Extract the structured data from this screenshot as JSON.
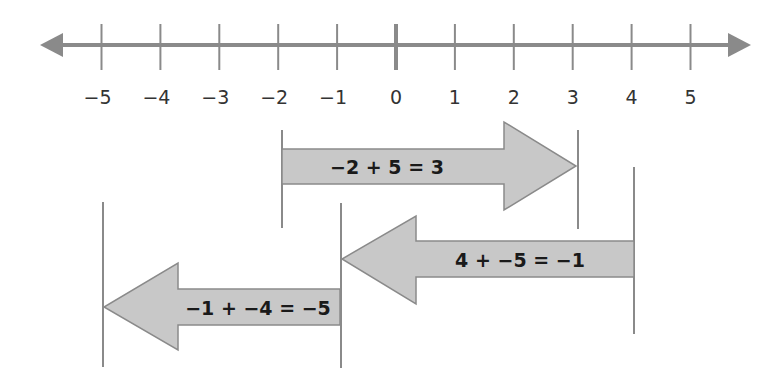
{
  "diagram": {
    "type": "number-line-addition",
    "number_line": {
      "min": -5,
      "max": 5,
      "tick_labels": [
        "−5",
        "−4",
        "−3",
        "−2",
        "−1",
        "0",
        "1",
        "2",
        "3",
        "4",
        "5"
      ],
      "tick_values": [
        -5,
        -4,
        -3,
        -2,
        -1,
        0,
        1,
        2,
        3,
        4,
        5
      ],
      "both_ends_arrows": true,
      "zero_tick_emphasized": true
    },
    "arrows": [
      {
        "label": "−2 + 5 = 3",
        "start": -2,
        "end": 3,
        "direction": "right"
      },
      {
        "label": "4 + −5 = −1",
        "start": 4,
        "end": -1,
        "direction": "left"
      },
      {
        "label": "−1 + −4 = −5",
        "start": -1,
        "end": -5,
        "direction": "left"
      }
    ],
    "colors": {
      "axis": "#8a8a8a",
      "arrow_fill": "#c8c8c8",
      "arrow_stroke": "#8a8a8a",
      "guide_line": "#8a8a8a",
      "text": "#1a1a1a"
    }
  }
}
